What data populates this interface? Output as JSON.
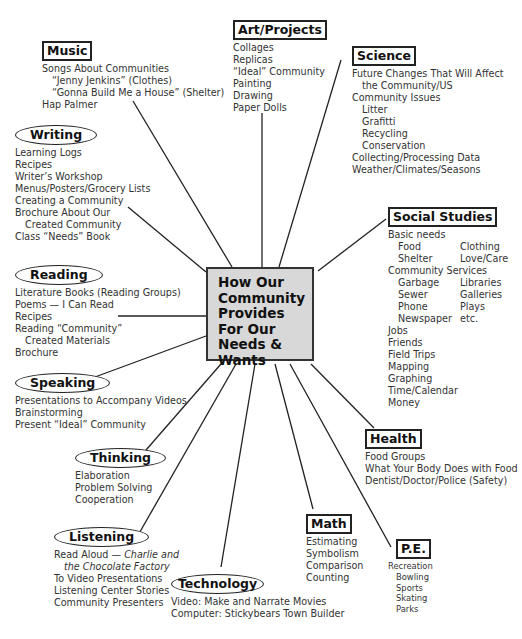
{
  "diagram": {
    "center": {
      "title": "How Our Community Provides For Our Needs & Wants"
    },
    "branches": {
      "music": {
        "title": "Music",
        "items": [
          "Songs About Communities",
          "“Jenny Jenkins” (Clothes)",
          "“Gonna Build Me a House” (Shelter)",
          "Hap Palmer"
        ]
      },
      "art": {
        "title": "Art/Projects",
        "items": [
          "Collages",
          "Replicas",
          "“Ideal” Community",
          "Painting",
          "Drawing",
          "Paper Dolls"
        ]
      },
      "science": {
        "title": "Science",
        "items": [
          "Future Changes That Will Affect",
          "the Community/US",
          "Community Issues",
          "Litter",
          "Grafitti",
          "Recycling",
          "Conservation",
          "Collecting/Processing Data",
          "Weather/Climates/Seasons"
        ]
      },
      "writing": {
        "title": "Writing",
        "items": [
          "Learning Logs",
          "Recipes",
          "Writer’s Workshop",
          "Menus/Posters/Grocery Lists",
          "Creating a Community",
          "Brochure About Our",
          "Created Community",
          "Class “Needs” Book"
        ]
      },
      "social": {
        "title": "Social Studies",
        "items": [
          "Basic needs",
          "Food",
          "Clothing",
          "Shelter",
          "Love/Care",
          "Community Services",
          "Garbage",
          "Libraries",
          "Sewer",
          "Galleries",
          "Phone",
          "Plays",
          "Newspaper",
          "etc.",
          "Jobs",
          "Friends",
          "Field Trips",
          "Mapping",
          "Graphing",
          "Time/Calendar",
          "Money"
        ]
      },
      "reading": {
        "title": "Reading",
        "items": [
          "Literature Books (Reading Groups)",
          "Poems — I Can Read",
          "Recipes",
          "Reading “Community”",
          "Created Materials",
          "Brochure"
        ]
      },
      "speaking": {
        "title": "Speaking",
        "items": [
          "Presentations to Accompany Videos",
          "Brainstorming",
          "Present “Ideal” Community"
        ]
      },
      "thinking": {
        "title": "Thinking",
        "items": [
          "Elaboration",
          "Problem Solving",
          "Cooperation"
        ]
      },
      "health": {
        "title": "Health",
        "items": [
          "Food Groups",
          "What Your Body Does with Food",
          "Dentist/Doctor/Police (Safety)"
        ]
      },
      "listening": {
        "title": "Listening",
        "items": [
          "Read Aloud — ",
          "Charlie and",
          "the Chocolate Factory",
          "To Video Presentations",
          "Listening Center Stories",
          "Community Presenters"
        ]
      },
      "math": {
        "title": "Math",
        "items": [
          "Estimating",
          "Symbolism",
          "Comparison",
          "Counting"
        ]
      },
      "pe": {
        "title": "P.E.",
        "items": [
          "Recreation",
          "Bowling",
          "Sports",
          "Skating",
          "Parks"
        ]
      },
      "technology": {
        "title": "Technology",
        "items": [
          "Video: Make and Narrate Movies",
          "Computer: Stickybears Town Builder"
        ]
      }
    },
    "colors": {
      "line": "#222222",
      "center_fill": "#d8d8d8",
      "text": "#333333"
    }
  }
}
